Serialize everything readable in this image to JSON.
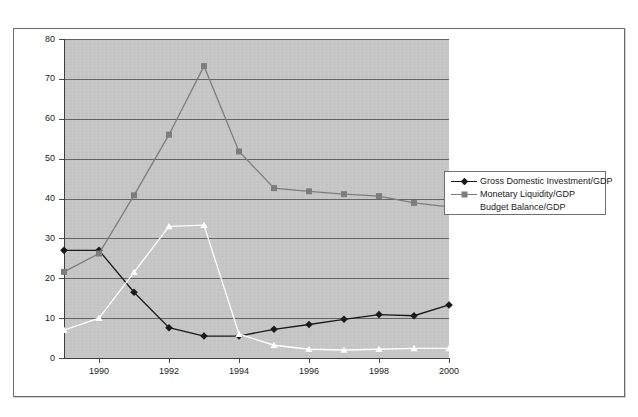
{
  "top_glyph": "°",
  "chart_data": {
    "type": "line",
    "title": "",
    "subtitle": "",
    "xlabel": "",
    "ylabel": "",
    "x": [
      1989,
      1990,
      1991,
      1992,
      1993,
      1994,
      1995,
      1996,
      1997,
      1998,
      1999,
      2000
    ],
    "xlim": [
      1989,
      2000
    ],
    "ylim": [
      0,
      80
    ],
    "ytick_values": [
      0,
      10,
      20,
      30,
      40,
      50,
      60,
      70,
      80
    ],
    "ytick_labels": [
      "0",
      "10",
      "20",
      "30",
      "40",
      "50",
      "60",
      "70",
      "80"
    ],
    "xtick_values": [
      1990,
      1992,
      1994,
      1996,
      1998,
      2000
    ],
    "xtick_labels": [
      "1990",
      "1992",
      "1994",
      "1996",
      "1998",
      "2000"
    ],
    "grid": "horizontal",
    "plot_background": "#c4c4c4",
    "legend_position": "upper-right-outside",
    "series": [
      {
        "name": "Gross Domestic Investment/GDP",
        "color": "#1a1a1a",
        "marker": "diamond",
        "values": [
          27.0,
          27.0,
          16.5,
          7.6,
          5.5,
          5.5,
          7.2,
          8.4,
          9.7,
          10.9,
          10.6,
          13.3
        ]
      },
      {
        "name": "Monetary Liquidity/GDP",
        "color": "#7d7d7d",
        "marker": "square",
        "values": [
          21.6,
          26.2,
          40.8,
          56.0,
          73.2,
          51.8,
          42.6,
          41.8,
          41.1,
          40.6,
          38.9,
          37.9
        ]
      },
      {
        "name": "Budget Balance/GDP",
        "color": "#ffffff",
        "marker": "triangle",
        "values": [
          7.0,
          10.0,
          21.5,
          33.0,
          33.3,
          6.0,
          3.2,
          2.2,
          2.0,
          2.2,
          2.4,
          2.4
        ]
      }
    ]
  },
  "legend": {
    "entries": [
      {
        "label": "Gross Domestic Investment/GDP"
      },
      {
        "label": "Monetary Liquidity/GDP"
      },
      {
        "label": "Budget Balance/GDP"
      }
    ]
  }
}
